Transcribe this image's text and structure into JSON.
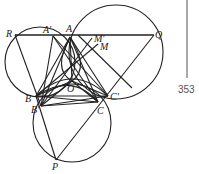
{
  "diagram": {
    "points": {
      "R": {
        "label": "R",
        "x": 15,
        "y": 35
      },
      "A": {
        "label": "A",
        "x": 70,
        "y": 37
      },
      "A_prime": {
        "label": "A'",
        "x": 53,
        "y": 36
      },
      "M_prime": {
        "label": "M'",
        "x": 96,
        "y": 36
      },
      "M": {
        "label": "M",
        "x": 100,
        "y": 44
      },
      "Q": {
        "label": "Q",
        "x": 154,
        "y": 35
      },
      "O": {
        "label": "O",
        "x": 72,
        "y": 81
      },
      "B": {
        "label": "B",
        "x": 36,
        "y": 96
      },
      "B_prime": {
        "label": "B'",
        "x": 41,
        "y": 106
      },
      "C_prime": {
        "label": "C'",
        "x": 108,
        "y": 96
      },
      "C": {
        "label": "C",
        "x": 98,
        "y": 102
      },
      "P": {
        "label": "P",
        "x": 56,
        "y": 160
      }
    },
    "page_number": "353"
  }
}
